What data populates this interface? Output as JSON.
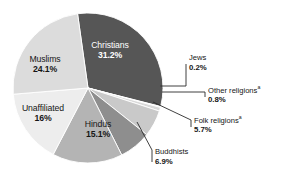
{
  "chart_data": {
    "type": "pie",
    "title": "",
    "subtitle": "",
    "xlabel": "",
    "ylabel": "",
    "legend_position": "none",
    "grid": false,
    "total_percent": 100,
    "start_angle_deg": -8,
    "direction": "clockwise",
    "categories": [
      "Christians",
      "Jews",
      "Other religions",
      "Folk religions",
      "Buddhists",
      "Hindus",
      "Unaffiliated",
      "Muslims"
    ],
    "values": [
      31.2,
      0.2,
      0.8,
      5.7,
      6.9,
      15.1,
      16,
      24.1
    ],
    "value_labels": [
      "31.2%",
      "0.2%",
      "0.8%",
      "5.7%",
      "6.9%",
      "15.1%",
      "16%",
      "24.1%"
    ],
    "colors": [
      "#565656",
      "#f2f2f2",
      "#d9d9d9",
      "#c9c9c9",
      "#8e8e8e",
      "#b4b4b4",
      "#ededed",
      "#dcdcdc"
    ],
    "slices": [
      {
        "name": "Christians",
        "value": 31.2,
        "value_label": "31.2%",
        "color": "#565656",
        "label_placement": "inside",
        "label_color": "#ffffff",
        "footnote_marker": ""
      },
      {
        "name": "Jews",
        "value": 0.2,
        "value_label": "0.2%",
        "color": "#f2f2f2",
        "label_placement": "callout",
        "label_color": "#161616",
        "footnote_marker": ""
      },
      {
        "name": "Other religions",
        "value": 0.8,
        "value_label": "0.8%",
        "color": "#d9d9d9",
        "label_placement": "callout",
        "label_color": "#161616",
        "footnote_marker": "a"
      },
      {
        "name": "Folk religions",
        "value": 5.7,
        "value_label": "5.7%",
        "color": "#c9c9c9",
        "label_placement": "callout",
        "label_color": "#161616",
        "footnote_marker": "a"
      },
      {
        "name": "Buddhists",
        "value": 6.9,
        "value_label": "6.9%",
        "color": "#8e8e8e",
        "label_placement": "callout",
        "label_color": "#161616",
        "footnote_marker": ""
      },
      {
        "name": "Hindus",
        "value": 15.1,
        "value_label": "15.1%",
        "color": "#b4b4b4",
        "label_placement": "inside",
        "label_color": "#161616",
        "footnote_marker": ""
      },
      {
        "name": "Unaffiliated",
        "value": 16,
        "value_label": "16%",
        "color": "#ededed",
        "label_placement": "inside",
        "label_color": "#161616",
        "footnote_marker": ""
      },
      {
        "name": "Muslims",
        "value": 24.1,
        "value_label": "24.1%",
        "color": "#dcdcdc",
        "label_placement": "inside",
        "label_color": "#161616",
        "footnote_marker": ""
      }
    ]
  },
  "labels": {
    "christians": {
      "name": "Christians",
      "value": "31.2%"
    },
    "muslims": {
      "name": "Muslims",
      "value": "24.1%"
    },
    "unaffiliated": {
      "name": "Unaffiliated",
      "value": "16%"
    },
    "hindus": {
      "name": "Hindus",
      "value": "15.1%"
    },
    "jews": {
      "name": "Jews",
      "value": "0.2%"
    },
    "other_religions": {
      "name": "Other religions",
      "marker": "a",
      "value": "0.8%"
    },
    "folk_religions": {
      "name": "Folk religions",
      "marker": "a",
      "value": "5.7%"
    },
    "buddhists": {
      "name": "Buddhists",
      "value": "6.9%"
    }
  },
  "style": {
    "background": "#ffffff",
    "leader_line_color": "#2b2b2b",
    "slice_outline": "#ffffff"
  }
}
